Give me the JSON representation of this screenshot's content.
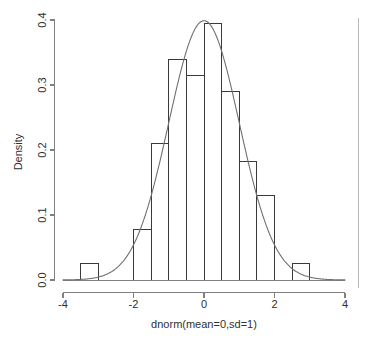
{
  "chart_data": {
    "type": "bar",
    "title": "",
    "subtitle": "",
    "xlabel": "dnorm(mean=0,sd=1)",
    "ylabel": "Density",
    "xlim": [
      -4,
      4
    ],
    "ylim": [
      0,
      0.4
    ],
    "grid": false,
    "legend": "none",
    "bin_width": 0.5,
    "bin_edges": [
      -3.5,
      -3.0,
      -2.5,
      -2.0,
      -1.5,
      -1.0,
      -0.5,
      0.0,
      0.5,
      1.0,
      1.5,
      2.0,
      2.5,
      3.0
    ],
    "categories": [
      "-3.5 to -3.0",
      "-3.0 to -2.5",
      "-2.5 to -2.0",
      "-2.0 to -1.5",
      "-1.5 to -1.0",
      "-1.0 to -0.5",
      "-0.5 to 0.0",
      "0.0 to 0.5",
      "0.5 to 1.0",
      "1.0 to 1.5",
      "1.5 to 2.0",
      "2.0 to 2.5",
      "2.5 to 3.0"
    ],
    "values": [
      0.025,
      0.0,
      0.0,
      0.078,
      0.21,
      0.34,
      0.315,
      0.395,
      0.29,
      0.183,
      0.13,
      0.0,
      0.025
    ],
    "x_ticks": [
      -4,
      -2,
      0,
      2,
      4
    ],
    "x_tick_labels": [
      "-4",
      "-2",
      "0",
      "2",
      "4"
    ],
    "y_ticks": [
      0.0,
      0.1,
      0.2,
      0.3,
      0.4
    ],
    "y_tick_labels": [
      "0.0",
      "0.1",
      "0.2",
      "0.3",
      "0.4"
    ],
    "overlay_curve": {
      "name": "normal density",
      "mean": 0,
      "sd": 1,
      "peak_value": 0.3989
    },
    "colors": {
      "bar_stroke": "#3a3a3a",
      "curve": "#707070",
      "axis": "#808080",
      "text": "#303030",
      "background": "#ffffff"
    }
  }
}
